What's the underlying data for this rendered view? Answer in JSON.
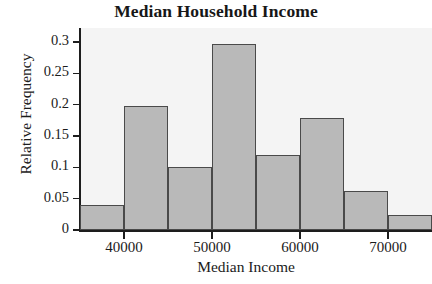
{
  "chart_data": {
    "type": "bar",
    "title": "Median Household Income",
    "xlabel": "Median Income",
    "ylabel": "Relative Frequency",
    "grid": false,
    "legend": null,
    "xlim": [
      35000,
      75000
    ],
    "ylim": [
      0,
      0.31
    ],
    "bin_width": 5000,
    "bin_edges": [
      35000,
      40000,
      45000,
      50000,
      55000,
      60000,
      65000,
      70000,
      75000
    ],
    "categories": [
      "35000-40000",
      "40000-45000",
      "45000-50000",
      "50000-55000",
      "55000-60000",
      "60000-65000",
      "65000-70000",
      "70000-75000"
    ],
    "values": [
      0.04,
      0.198,
      0.1,
      0.297,
      0.12,
      0.179,
      0.063,
      0.024
    ],
    "xtick_labels": [
      "40000",
      "50000",
      "60000",
      "70000"
    ],
    "xtick_values": [
      40000,
      50000,
      60000,
      70000
    ],
    "ytick_labels": [
      "0",
      "0.05",
      "0.1",
      "0.15",
      "0.2",
      "0.25",
      "0.3"
    ],
    "ytick_values": [
      0,
      0.05,
      0.1,
      0.15,
      0.2,
      0.25,
      0.3
    ],
    "colors": {
      "bar_fill": "#b9b9b9",
      "bar_edge": "#4a4a4a",
      "axis": "#1d1d1d",
      "plot_background": "#f4f4f4",
      "text": "#1b1b1b"
    }
  }
}
